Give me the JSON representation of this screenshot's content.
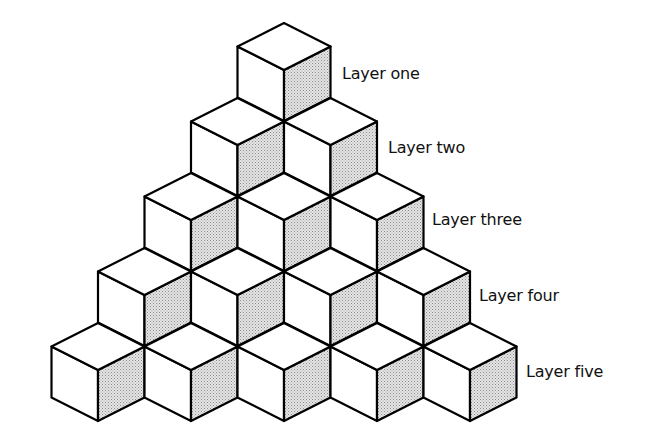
{
  "diagram": {
    "type": "isometric-cube-pyramid",
    "colors": {
      "stroke": "#000000",
      "top_face": "#ffffff",
      "left_face": "#ffffff",
      "right_face_stipple": "#d0d0d0"
    },
    "layers": [
      {
        "label": "Layer one",
        "cube_count": 1
      },
      {
        "label": "Layer two",
        "cube_count": 2
      },
      {
        "label": "Layer three",
        "cube_count": 3
      },
      {
        "label": "Layer four",
        "cube_count": 4
      },
      {
        "label": "Layer five",
        "cube_count": 5
      }
    ]
  }
}
